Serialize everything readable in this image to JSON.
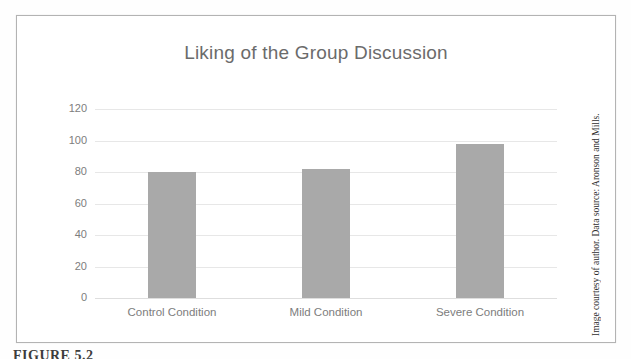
{
  "figure": {
    "caption": "FIGURE 5.2",
    "attribution": "Image courtesy of author. Data source: Aronson and Mills."
  },
  "chart_data": {
    "type": "bar",
    "title": "Liking of the Group Discussion",
    "categories": [
      "Control Condition",
      "Mild Condition",
      "Severe Condition"
    ],
    "values": [
      80,
      82,
      98
    ],
    "xlabel": "",
    "ylabel": "",
    "ylim": [
      0,
      120
    ],
    "yticks": [
      0,
      20,
      40,
      60,
      80,
      100,
      120
    ],
    "grid": true,
    "legend": false,
    "colors": {
      "bar": "#a9a9a9",
      "title_text": "#6b6b6b",
      "axis_text": "#7d7d7d",
      "gridline": "#e7e7e7",
      "frame_border": "#b3b3b3",
      "attribution_text": "#2e2e2e",
      "caption_text": "#3c3c3c"
    }
  }
}
